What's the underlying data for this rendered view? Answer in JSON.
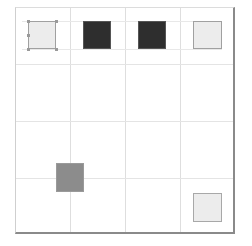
{
  "grid": {
    "rows": 4,
    "cols": 4,
    "line_color": "#dedede",
    "frame_shadow_color": "#8a8a8a"
  },
  "squares": [
    {
      "id": "sq-r1c1",
      "row": 1,
      "col": 1,
      "fill": "#ececec",
      "border": "#a0a0a0",
      "selected": true
    },
    {
      "id": "sq-r1c2",
      "row": 1,
      "col": 2,
      "fill": "#2e2e2e",
      "border": "#555555",
      "selected": false
    },
    {
      "id": "sq-r1c3",
      "row": 1,
      "col": 3,
      "fill": "#2e2e2e",
      "border": "#555555",
      "selected": false
    },
    {
      "id": "sq-r1c4",
      "row": 1,
      "col": 4,
      "fill": "#ececec",
      "border": "#a0a0a0",
      "selected": false
    },
    {
      "id": "sq-r4c2",
      "row": 4,
      "col": 2,
      "fill": "#8c8c8c",
      "border": "#9a9a9a",
      "selected": false
    },
    {
      "id": "sq-r4c4",
      "row": 4,
      "col": 4,
      "fill": "#ececec",
      "border": "#a8a8a8",
      "selected": false
    }
  ]
}
